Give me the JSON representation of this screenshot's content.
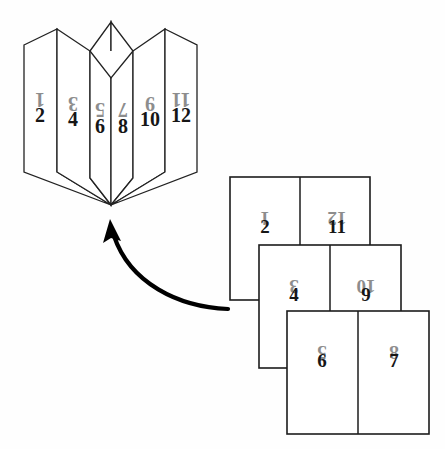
{
  "figure": {
    "background_color": "#fefefe",
    "ink_color": "#1c1c1c",
    "upright_number_color": "#161616",
    "rotated_number_color": "#8d8d8d"
  },
  "folded_book": {
    "label": "folded-signature",
    "convergence_point": {
      "x": 111,
      "y": 205
    },
    "panels": [
      {
        "index": 0,
        "rotated_number": "1",
        "upright_number": "2",
        "x": 40,
        "rot_y": 93,
        "up_y": 122
      },
      {
        "index": 1,
        "rotated_number": "3",
        "upright_number": "4",
        "x": 73,
        "rot_y": 97,
        "up_y": 126
      },
      {
        "index": 2,
        "rotated_number": "5",
        "upright_number": "6",
        "x": 100,
        "rot_y": 103,
        "up_y": 133
      },
      {
        "index": 3,
        "rotated_number": "7",
        "upright_number": "8",
        "x": 123,
        "rot_y": 103,
        "up_y": 133
      },
      {
        "index": 4,
        "rotated_number": "9",
        "upright_number": "10",
        "x": 150,
        "rot_y": 97,
        "up_y": 126
      },
      {
        "index": 5,
        "rotated_number": "11",
        "upright_number": "12",
        "x": 181,
        "rot_y": 93,
        "up_y": 122
      }
    ]
  },
  "flat_stack": {
    "label": "flat-imposition-stack",
    "sheets": [
      {
        "index": 0,
        "name": "top-sheet",
        "x": 230,
        "y": 177,
        "width": 140,
        "height": 123,
        "left_page": {
          "rotated_number": "1",
          "upright_number": "2"
        },
        "right_page": {
          "rotated_number": "12",
          "upright_number": "11"
        }
      },
      {
        "index": 1,
        "name": "middle-sheet",
        "x": 259,
        "y": 245,
        "width": 142,
        "height": 123,
        "left_page": {
          "rotated_number": "3",
          "upright_number": "4"
        },
        "right_page": {
          "rotated_number": "10",
          "upright_number": "9"
        }
      },
      {
        "index": 2,
        "name": "bottom-sheet",
        "x": 287,
        "y": 311,
        "width": 142,
        "height": 123,
        "left_page": {
          "rotated_number": "5",
          "upright_number": "6"
        },
        "right_page": {
          "rotated_number": "8",
          "upright_number": "7"
        }
      }
    ]
  },
  "arrow": {
    "name": "folding-direction-arrow",
    "description": "curved arrow from the flat stack to the folded signature",
    "start": {
      "x": 228,
      "y": 309
    },
    "end": {
      "x": 110,
      "y": 228
    },
    "color": "#000000"
  }
}
